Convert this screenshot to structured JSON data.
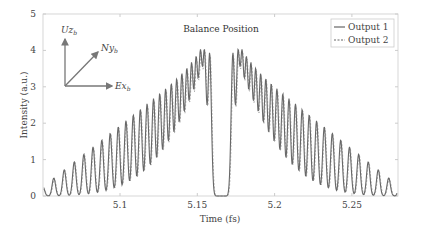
{
  "chart_data": {
    "type": "line",
    "title": "",
    "annotation": "Balance Position",
    "xlabel": "Time (fs)",
    "ylabel": "Intensity (a.u.)",
    "xlim": [
      5.05,
      5.28
    ],
    "ylim": [
      0,
      5
    ],
    "xticks": [
      5.1,
      5.15,
      5.2,
      5.25
    ],
    "xtick_labels": [
      "5.1",
      "5.15",
      "5.2",
      "5.25"
    ],
    "yticks": [
      0,
      1,
      2,
      3,
      4,
      5
    ],
    "ytick_labels": [
      "0",
      "1",
      "2",
      "3",
      "4",
      "5"
    ],
    "grid": false,
    "legend_position": "upper right",
    "series": [
      {
        "name": "Output 1",
        "style": "solid",
        "color": "#666666"
      },
      {
        "name": "Output 2",
        "style": "dashed",
        "color": "#666666"
      }
    ],
    "center_time": 5.1655,
    "peak_envelope": {
      "description": "Interference fringe peaks with triangular envelope; max ~4.1 near center, ~0.25 at edges; two isolated tall peaks flank center gap",
      "left_edge_peak": {
        "x": 5.056,
        "y": 0.25
      },
      "center_left_peak": {
        "x": 5.158,
        "y": 4.1
      },
      "center_right_peak": {
        "x": 5.173,
        "y": 4.15
      },
      "right_edge_peak": {
        "x": 5.281,
        "y": 0.2
      }
    }
  },
  "inset": {
    "axes": [
      {
        "label": "Uz",
        "sub": "b"
      },
      {
        "label": "Ny",
        "sub": "b"
      },
      {
        "label": "Ex",
        "sub": "b"
      }
    ]
  },
  "legend": {
    "items": [
      {
        "label": "Output 1"
      },
      {
        "label": "Output 2"
      }
    ]
  }
}
